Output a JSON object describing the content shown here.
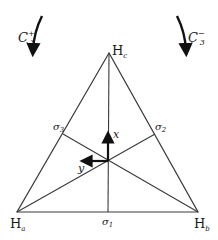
{
  "diagram": {
    "type": "symmetry-triangle",
    "colors": {
      "line": "#3a3a3a",
      "arrow": "#111111",
      "text": "#1a1a1a"
    },
    "rotations": {
      "left": {
        "symbol": "C",
        "sup": "+",
        "sub": "3"
      },
      "right": {
        "symbol": "C",
        "sup": "−",
        "sub": "3"
      }
    },
    "vertices": {
      "top": {
        "atom": "H",
        "sub": "c"
      },
      "left": {
        "atom": "H",
        "sub": "a"
      },
      "right": {
        "atom": "H",
        "sub": "b"
      }
    },
    "mirror_planes": {
      "bottom": {
        "symbol": "σ",
        "sub": "1"
      },
      "right": {
        "symbol": "σ",
        "sub": "2"
      },
      "left": {
        "symbol": "σ",
        "sub": "3"
      }
    },
    "axes": {
      "x": "x",
      "y": "y"
    }
  }
}
